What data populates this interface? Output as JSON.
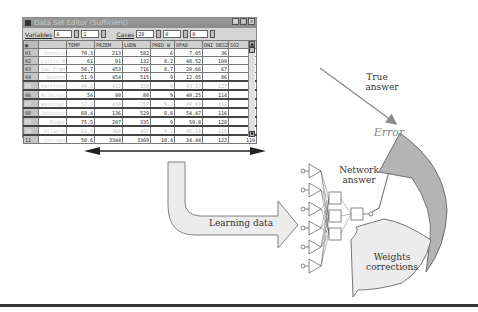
{
  "window": {
    "title": "Data Set Editor (Sufficient)",
    "controls": [
      "_",
      "□",
      "×"
    ],
    "toolbar": {
      "variables_label": "Variables",
      "variables_value": "6",
      "variables_value2": "1",
      "cases_label": "Cases",
      "cases_value": "28",
      "cases_value2": "0",
      "cases_value3": "0"
    },
    "columns": [
      "",
      "NAME",
      "TEMP",
      "PRZEM",
      "LUDN",
      "PRED_W",
      "OPAD",
      "DNI_DESZ",
      "SO2"
    ],
    "rows": [
      {
        "id": "01",
        "name": "Phoenix",
        "values": [
          "70.3",
          "213",
          "582",
          "6",
          "7.05",
          "36",
          "10"
        ]
      },
      {
        "id": "02",
        "name": "Little R",
        "values": [
          "61",
          "91",
          "132",
          "8.2",
          "48.52",
          "100",
          "13"
        ]
      },
      {
        "id": "03",
        "name": "San Fran",
        "values": [
          "56.7",
          "453",
          "716",
          "8.7",
          "20.66",
          "67",
          "12"
        ]
      },
      {
        "id": "04",
        "name": "Denver",
        "values": [
          "51.9",
          "454",
          "515",
          "9",
          "12.95",
          "86",
          "17"
        ]
      },
      {
        "id": "05",
        "name": "Hartford",
        "values": [
          "49.1",
          "412",
          "158",
          "9",
          "43.37",
          "127",
          "56"
        ]
      },
      {
        "id": "06",
        "name": "Wilmingt",
        "values": [
          "54",
          "80",
          "80",
          "9",
          "40.25",
          "114",
          "36"
        ]
      },
      {
        "id": "07",
        "name": "Washingt",
        "values": [
          "57.3",
          "434",
          "757",
          "9.3",
          "38.89",
          "111",
          "29"
        ]
      },
      {
        "id": "08",
        "name": "Jacksonv",
        "values": [
          "68.4",
          "136",
          "529",
          "8.8",
          "54.47",
          "116",
          "14"
        ]
      },
      {
        "id": "09",
        "name": "Miami",
        "values": [
          "75.5",
          "207",
          "335",
          "9",
          "59.8",
          "128",
          "10"
        ]
      },
      {
        "id": "10",
        "name": "Atlanta",
        "values": [
          "61.5",
          "368",
          "497",
          "9.1",
          "48.34",
          "115",
          "24"
        ]
      },
      {
        "id": "11",
        "name": "Chicago",
        "values": [
          "50.6",
          "3344",
          "3369",
          "10.4",
          "34.44",
          "122",
          "110"
        ]
      }
    ]
  },
  "diagram": {
    "true_answer": [
      "True",
      "answer"
    ],
    "error": "Error",
    "network_answer": [
      "Network",
      "answer"
    ],
    "learning_data": "Learning data",
    "weights_corrections": [
      "Weights",
      "corrections"
    ],
    "colors": {
      "arrow_gray": "#8c8c8c",
      "light_fill": "#ececec",
      "dark_fill": "#b4b4b4",
      "line": "#555555",
      "error_text": "#888888"
    }
  }
}
